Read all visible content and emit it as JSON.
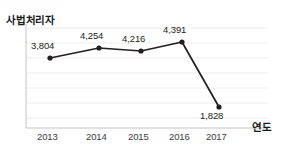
{
  "top_cutoff_text": "······················",
  "axis_titles": {
    "y": "사법처리자",
    "x": "연도"
  },
  "colors": {
    "line": "#231f20",
    "marker": "#231f20",
    "grid": "#e9e9ea",
    "axis": "#bdbdbd",
    "background": "#ffffff",
    "text": "#231f20"
  },
  "chart_data": {
    "type": "line",
    "title": "",
    "subtitle": "",
    "xlabel": "연도",
    "ylabel": "사법처리자",
    "categories": [
      "2013",
      "2014",
      "2015",
      "2016",
      "2017"
    ],
    "values": [
      3804,
      4254,
      4216,
      4391,
      1828
    ],
    "data_labels": [
      "3,804",
      "4,254",
      "4,216",
      "4,391",
      "1,828"
    ],
    "tick_labels": [
      "2013",
      "2014",
      "2015",
      "2016",
      "2017"
    ],
    "ylim": [
      1200,
      4800
    ],
    "y_tick_labels": [],
    "grid": true,
    "gridline_count": 7,
    "legend": null,
    "legend_position": "none",
    "series": [
      {
        "name": "사법처리자",
        "values": [
          3804,
          4254,
          4216,
          4391,
          1828
        ]
      }
    ],
    "points": [
      {
        "category": "2013",
        "value": 3804,
        "label": "3,804",
        "cx": 50,
        "cy": 58,
        "label_x": 31,
        "label_y": 40,
        "label_pos": "above"
      },
      {
        "category": "2014",
        "value": 4254,
        "label": "4,254",
        "cx": 99,
        "cy": 48,
        "label_x": 80,
        "label_y": 30,
        "label_pos": "above"
      },
      {
        "category": "2015",
        "value": 4216,
        "label": "4,216",
        "cx": 141,
        "cy": 51,
        "label_x": 122,
        "label_y": 33,
        "label_pos": "above"
      },
      {
        "category": "2016",
        "value": 4391,
        "label": "4,391",
        "cx": 182,
        "cy": 42,
        "label_x": 163,
        "label_y": 24,
        "label_pos": "above"
      },
      {
        "category": "2017",
        "value": 1828,
        "label": "1,828",
        "cx": 219,
        "cy": 107,
        "label_x": 200,
        "label_y": 110,
        "label_pos": "below"
      }
    ],
    "x_tick_positions": [
      {
        "label": "2013",
        "x": 37
      },
      {
        "label": "2014",
        "x": 86
      },
      {
        "label": "2015",
        "x": 128
      },
      {
        "label": "2016",
        "x": 169
      },
      {
        "label": "2017",
        "x": 206
      }
    ],
    "gridline_y": [
      28,
      43,
      58,
      73,
      88,
      103,
      118
    ],
    "axis_geometry": {
      "left": 26,
      "bottom": 128,
      "right": 268,
      "top": 24
    }
  }
}
